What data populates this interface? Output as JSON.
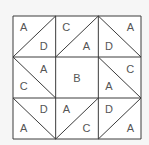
{
  "diagram": {
    "type": "quilt-block-grid",
    "rows": 3,
    "cols": 3,
    "colors": {
      "line": "#3c3c3c",
      "text": "#555555",
      "fill": "#ffffff",
      "background": "#f6f6f6"
    },
    "cells": [
      {
        "row": 0,
        "col": 0,
        "diagonal": "/",
        "labels": [
          {
            "pos": "top-left",
            "text": "A"
          },
          {
            "pos": "bottom-right",
            "text": "D"
          }
        ]
      },
      {
        "row": 0,
        "col": 1,
        "diagonal": "/",
        "labels": [
          {
            "pos": "top-left",
            "text": "C"
          },
          {
            "pos": "bottom-right",
            "text": "A"
          }
        ]
      },
      {
        "row": 0,
        "col": 2,
        "diagonal": "\\",
        "labels": [
          {
            "pos": "bottom-left",
            "text": "D"
          },
          {
            "pos": "top-right",
            "text": "A"
          }
        ]
      },
      {
        "row": 1,
        "col": 0,
        "diagonal": "\\",
        "labels": [
          {
            "pos": "top-right",
            "text": "A"
          },
          {
            "pos": "bottom-left",
            "text": "C"
          }
        ]
      },
      {
        "row": 1,
        "col": 1,
        "diagonal": "none",
        "labels": [
          {
            "pos": "center",
            "text": "B"
          }
        ]
      },
      {
        "row": 1,
        "col": 2,
        "diagonal": "\\",
        "labels": [
          {
            "pos": "top-right",
            "text": "C"
          },
          {
            "pos": "bottom-left",
            "text": "A"
          }
        ]
      },
      {
        "row": 2,
        "col": 0,
        "diagonal": "\\",
        "labels": [
          {
            "pos": "top-right",
            "text": "D"
          },
          {
            "pos": "bottom-left",
            "text": "A"
          }
        ]
      },
      {
        "row": 2,
        "col": 1,
        "diagonal": "/",
        "labels": [
          {
            "pos": "top-left",
            "text": "A"
          },
          {
            "pos": "bottom-right",
            "text": "C"
          }
        ]
      },
      {
        "row": 2,
        "col": 2,
        "diagonal": "/",
        "labels": [
          {
            "pos": "top-left",
            "text": "D"
          },
          {
            "pos": "bottom-right",
            "text": "A"
          }
        ]
      }
    ]
  }
}
